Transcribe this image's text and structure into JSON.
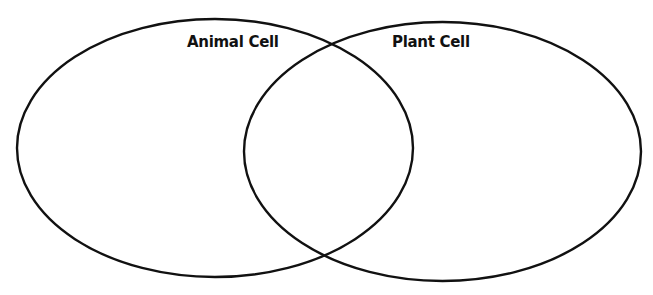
{
  "diagram": {
    "type": "venn",
    "sets": [
      {
        "label": "Animal Cell",
        "items": []
      },
      {
        "label": "Plant Cell",
        "items": []
      }
    ],
    "intersection_items": [],
    "stroke_color": "#111111",
    "background": "#ffffff"
  }
}
